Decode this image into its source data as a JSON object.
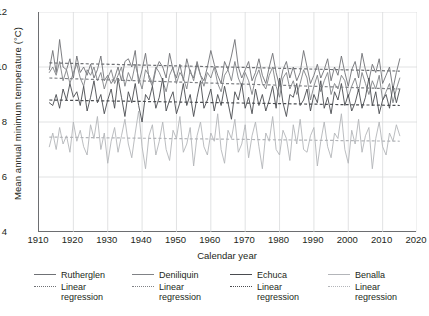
{
  "chart_data": {
    "type": "line",
    "title": "",
    "xlabel": "Calendar year",
    "ylabel": "Mean annual minimum temperature (°C)",
    "xlim": [
      1910,
      2020
    ],
    "ylim": [
      4,
      12
    ],
    "xticks": [
      1910,
      1920,
      1930,
      1940,
      1950,
      1960,
      1970,
      1980,
      1990,
      2000,
      2010,
      2020
    ],
    "yticks": [
      4,
      6,
      8,
      10,
      12
    ],
    "y_minor_ticks": [
      5,
      7,
      9,
      11
    ],
    "grid": "horizontal and vertical gridlines at major ticks",
    "legend_position": "below plot, four columns",
    "legend_entries": [
      "Rutherglen",
      "Linear regression",
      "Deniliquin",
      "Linear regression",
      "Echuca",
      "Linear regression",
      "Benalla",
      "Linear regression"
    ],
    "colors": {
      "rutherglen": "#6f7175",
      "deniliquin": "#808286",
      "echuca": "#4a4c50",
      "benalla": "#b3b5b9",
      "axis": "#6d6e71",
      "grid": "#d9dadc",
      "text": "#231f20"
    },
    "series": [
      {
        "name": "Rutherglen",
        "color": "#6f7175",
        "x_start": 1913,
        "x_end": 2015,
        "regression": {
          "x": [
            1913,
            2015
          ],
          "y": [
            10.15,
            9.85
          ]
        },
        "values": [
          9.9,
          10.6,
          9.8,
          11.0,
          10.0,
          9.9,
          10.3,
          9.6,
          10.4,
          9.8,
          10.0,
          9.7,
          10.1,
          9.6,
          9.9,
          10.4,
          9.5,
          9.7,
          9.4,
          9.6,
          10.0,
          9.5,
          10.2,
          10.3,
          10.0,
          10.6,
          9.4,
          9.9,
          10.5,
          9.6,
          9.3,
          9.9,
          10.2,
          10.0,
          9.6,
          10.5,
          9.9,
          9.6,
          10.1,
          9.5,
          10.3,
          9.8,
          9.6,
          10.2,
          9.7,
          9.5,
          10.0,
          10.6,
          10.1,
          9.7,
          9.4,
          10.2,
          9.9,
          10.4,
          11.0,
          10.0,
          9.6,
          9.9,
          10.2,
          9.5,
          9.8,
          10.3,
          9.7,
          9.4,
          10.0,
          10.5,
          9.8,
          9.3,
          9.9,
          10.2,
          9.6,
          10.0,
          9.5,
          9.8,
          10.6,
          10.0,
          9.4,
          9.7,
          10.1,
          9.6,
          9.9,
          10.3,
          9.5,
          10.0,
          9.7,
          10.4,
          9.8,
          9.3,
          9.9,
          10.2,
          9.6,
          10.5,
          9.9,
          9.5,
          10.1,
          9.8,
          10.3,
          9.4,
          9.7,
          10.0,
          9.2,
          9.8,
          10.3
        ]
      },
      {
        "name": "Deniliquin",
        "color": "#808286",
        "x_start": 1913,
        "x_end": 2015,
        "regression": {
          "x": [
            1913,
            2015
          ],
          "y": [
            9.6,
            9.2
          ]
        },
        "values": [
          9.8,
          10.0,
          9.7,
          10.2,
          9.5,
          9.9,
          9.4,
          9.8,
          10.1,
          9.6,
          9.3,
          9.9,
          9.7,
          10.0,
          9.5,
          9.8,
          9.2,
          9.6,
          9.9,
          9.4,
          9.7,
          10.0,
          9.3,
          9.8,
          9.5,
          10.1,
          9.6,
          9.2,
          9.9,
          9.7,
          9.4,
          10.0,
          9.8,
          9.5,
          9.1,
          9.7,
          10.0,
          9.4,
          9.8,
          9.6,
          9.2,
          9.9,
          9.5,
          10.1,
          9.7,
          9.3,
          9.8,
          9.6,
          10.0,
          9.4,
          9.1,
          9.7,
          9.9,
          9.5,
          10.2,
          9.6,
          9.3,
          9.8,
          9.5,
          9.0,
          9.6,
          9.9,
          9.4,
          9.2,
          9.7,
          10.0,
          9.3,
          8.9,
          9.6,
          9.8,
          9.2,
          9.5,
          9.0,
          9.4,
          9.9,
          9.6,
          8.8,
          9.3,
          9.7,
          9.1,
          9.5,
          9.8,
          9.0,
          9.4,
          9.2,
          9.7,
          9.5,
          8.9,
          9.3,
          9.6,
          9.1,
          9.8,
          9.4,
          9.0,
          9.5,
          9.2,
          9.7,
          8.8,
          9.1,
          9.4,
          8.7,
          9.2,
          9.6
        ]
      },
      {
        "name": "Echuca",
        "color": "#4a4c50",
        "x_start": 1913,
        "x_end": 2015,
        "regression": {
          "x": [
            1913,
            2015
          ],
          "y": [
            8.8,
            8.6
          ]
        },
        "values": [
          8.7,
          8.6,
          9.0,
          8.5,
          9.2,
          8.8,
          9.4,
          8.9,
          9.1,
          8.6,
          9.3,
          8.4,
          8.9,
          9.5,
          8.7,
          9.0,
          8.3,
          8.8,
          9.2,
          8.5,
          9.6,
          8.9,
          8.2,
          9.1,
          8.7,
          9.4,
          8.6,
          8.0,
          9.0,
          8.8,
          9.3,
          8.5,
          8.9,
          9.6,
          8.4,
          8.8,
          9.1,
          8.3,
          8.7,
          9.4,
          8.6,
          9.0,
          8.2,
          8.9,
          9.5,
          8.5,
          8.8,
          9.2,
          8.4,
          9.0,
          8.6,
          9.3,
          8.7,
          8.1,
          9.1,
          8.8,
          9.4,
          8.5,
          8.9,
          8.3,
          9.2,
          8.6,
          9.0,
          8.4,
          8.8,
          9.3,
          8.5,
          9.6,
          8.7,
          8.2,
          9.0,
          8.9,
          9.4,
          8.6,
          8.8,
          9.2,
          8.4,
          9.0,
          8.7,
          9.5,
          8.5,
          8.9,
          8.3,
          9.1,
          8.8,
          9.4,
          8.6,
          9.0,
          8.4,
          8.7,
          9.2,
          8.5,
          8.9,
          9.6,
          8.6,
          9.1,
          8.3,
          8.8,
          9.0,
          8.5,
          9.3,
          8.7,
          9.2
        ]
      },
      {
        "name": "Benalla",
        "color": "#b3b5b9",
        "x_start": 1913,
        "x_end": 2015,
        "regression": {
          "x": [
            1913,
            2015
          ],
          "y": [
            7.45,
            7.3
          ]
        },
        "values": [
          7.1,
          7.6,
          7.0,
          7.8,
          7.2,
          7.5,
          6.9,
          8.0,
          7.3,
          7.7,
          7.1,
          6.8,
          7.9,
          7.4,
          8.2,
          7.0,
          7.6,
          6.5,
          7.3,
          7.8,
          6.9,
          7.5,
          8.1,
          7.2,
          6.7,
          7.6,
          8.4,
          7.1,
          6.3,
          7.5,
          7.9,
          6.8,
          7.3,
          8.0,
          7.0,
          6.6,
          7.7,
          7.4,
          8.2,
          6.9,
          7.2,
          7.8,
          6.4,
          7.5,
          8.0,
          7.1,
          6.8,
          7.6,
          7.3,
          8.3,
          7.0,
          6.5,
          7.7,
          7.4,
          8.1,
          6.9,
          7.2,
          7.9,
          6.7,
          7.5,
          8.0,
          7.1,
          6.3,
          7.6,
          7.3,
          8.2,
          7.0,
          6.8,
          7.7,
          7.4,
          6.6,
          7.9,
          7.2,
          8.1,
          7.0,
          6.9,
          7.5,
          7.8,
          6.4,
          7.3,
          8.0,
          7.1,
          6.7,
          7.6,
          7.4,
          8.3,
          7.0,
          6.5,
          7.7,
          7.2,
          8.1,
          6.9,
          7.5,
          7.8,
          6.3,
          7.4,
          8.0,
          7.1,
          6.8,
          7.6,
          7.3,
          7.9,
          7.5
        ]
      }
    ]
  },
  "axes": {
    "y_title": "Mean annual minimum temperature (°C)",
    "x_title": "Calendar year",
    "x_labels": [
      "1910",
      "1920",
      "1930",
      "1940",
      "1950",
      "1960",
      "1970",
      "1980",
      "1990",
      "2000",
      "2010",
      "2020"
    ],
    "y_labels": [
      "12",
      "10",
      "8",
      "6",
      "4"
    ]
  },
  "legend": {
    "columns": [
      {
        "name": "Rutherglen",
        "regression_line1": "Linear",
        "regression_line2": "regression"
      },
      {
        "name": "Deniliquin",
        "regression_line1": "Linear",
        "regression_line2": "regression"
      },
      {
        "name": "Echuca",
        "regression_line1": "Linear",
        "regression_line2": "regression"
      },
      {
        "name": "Benalla",
        "regression_line1": "Linear",
        "regression_line2": "regression"
      }
    ]
  }
}
